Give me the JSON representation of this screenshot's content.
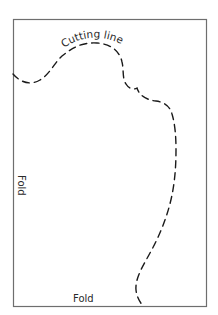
{
  "diagram": {
    "type": "pattern-template",
    "colors": {
      "background": "#ffffff",
      "border": "#6e6e6e",
      "cutting_line": "#1a1a1a",
      "text": "#2a2a2a"
    },
    "labels": {
      "cutting_line": "Cutting line",
      "fold_left": "Fold",
      "fold_bottom": "Fold"
    }
  }
}
